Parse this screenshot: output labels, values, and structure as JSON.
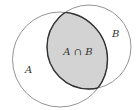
{
  "diagram": {
    "type": "venn",
    "sets": [
      {
        "id": "A",
        "label": "A",
        "cx": 60,
        "cy": 59.5,
        "r": 47.5,
        "label_x": 25,
        "label_y": 73
      },
      {
        "id": "B",
        "label": "B",
        "cx": 89,
        "cy": 47,
        "r": 42,
        "label_x": 112,
        "label_y": 37
      }
    ],
    "intersection": {
      "label": "A ∩ B",
      "label_x": 78,
      "label_y": 55,
      "fill": "#d3d3d3",
      "stroke": "#333333"
    },
    "colors": {
      "circle_stroke": "#888888",
      "background": "#ffffff"
    }
  }
}
